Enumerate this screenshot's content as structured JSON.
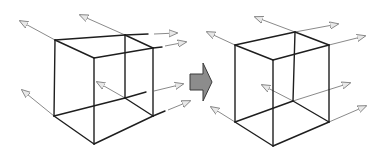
{
  "diagram": {
    "title": "",
    "colors": {
      "edge": "#1e1e1e",
      "ray": "#8a8a8a",
      "arrowhead_fill": "#e8e8e8",
      "transition_arrow": "#8c8c8c"
    },
    "figures": [
      {
        "id": "cube-before",
        "label": "",
        "vertex_count": 8,
        "ray_count": 9
      },
      {
        "id": "cube-after",
        "label": "",
        "vertex_count": 8,
        "ray_count": 8
      }
    ],
    "transition_icon": "right-arrow-icon"
  }
}
